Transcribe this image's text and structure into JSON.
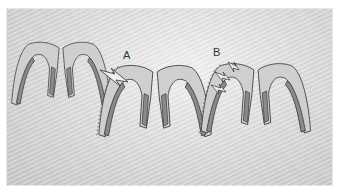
{
  "figure": {
    "panels": [
      {
        "id": "original",
        "label": ""
      },
      {
        "id": "A",
        "label": "A"
      },
      {
        "id": "B",
        "label": "B"
      }
    ],
    "colors": {
      "outer_fill": "#cfcfcf",
      "inner_fill": "#8a8a8a",
      "outline": "#3a3a3a",
      "arrow_fill": "#efefef"
    }
  }
}
